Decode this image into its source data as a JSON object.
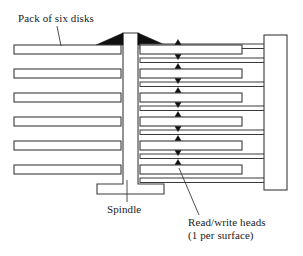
{
  "figure": {
    "type": "technical-line-diagram",
    "background_color": "#ffffff",
    "stroke_color": "#3a3a3a",
    "fill_color": "#ffffff",
    "solid_black": "#101010"
  },
  "labels": {
    "pack_of_disks": "Pack of six disks",
    "spindle": "Spindle",
    "read_write_heads_line1": "Read/write heads",
    "read_write_heads_line2": "(1 per surface)"
  },
  "components": {
    "disk_count": 6,
    "head_count": 11,
    "actuator_arm_count": 7,
    "spindle_label": "Spindle",
    "actuator_block_label": "actuator-block"
  },
  "geometry": {
    "disk_rows_y": [
      45,
      69,
      93,
      117,
      141,
      165
    ],
    "disk_height": 9,
    "left_disk_x": 14,
    "left_disk_right": 121,
    "right_disk_x": 140,
    "right_disk_right": 242,
    "spindle_left": 123,
    "spindle_right": 138,
    "spindle_top": 33,
    "spindle_base_y": 184,
    "spindle_foot_left": 97,
    "spindle_foot_right": 164,
    "spindle_foot_bottom": 194,
    "actuator_block_x": 264,
    "actuator_block_right": 287,
    "actuator_block_top": 35,
    "actuator_block_bottom": 190,
    "arm_rows_y": [
      58,
      82,
      106,
      130,
      154,
      178,
      44
    ],
    "head_x": 178
  },
  "leader_lines": {
    "pack_of_disks": {
      "x1": 57,
      "y1": 26,
      "x2": 61,
      "y2": 46
    },
    "spindle": {
      "x1": 127,
      "y1": 202,
      "x2": 127,
      "y2": 180
    },
    "read_write_heads": {
      "x1": 199,
      "y1": 215,
      "x2": 179,
      "y2": 168
    }
  }
}
